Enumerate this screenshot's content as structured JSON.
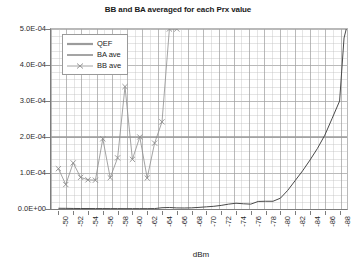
{
  "chart_data": {
    "type": "line",
    "title": "BB and BA averaged for each Prx value",
    "xlabel": "dBm",
    "ylabel": "",
    "xlim": [
      -49,
      -89
    ],
    "ylim": [
      0,
      0.0005
    ],
    "grid": true,
    "legend_position": "top-left",
    "x_tick_labels": [
      "-50",
      "-52",
      "-54",
      "-56",
      "-58",
      "-60",
      "-62",
      "-64",
      "-66",
      "-68",
      "-70",
      "-72",
      "-74",
      "-76",
      "-78",
      "-80",
      "-82",
      "-84",
      "-86",
      "-88"
    ],
    "x_tick_values": [
      -50,
      -52,
      -54,
      -56,
      -58,
      -60,
      -62,
      -64,
      -66,
      -68,
      -70,
      -72,
      -74,
      -76,
      -78,
      -80,
      -82,
      -84,
      -86,
      -88
    ],
    "y_tick_labels": [
      "0.0E+00",
      "1.0E-04",
      "2.0E-04",
      "3.0E-04",
      "4.0E-04",
      "5.0E-04"
    ],
    "y_tick_values": [
      0,
      0.0001,
      0.0002,
      0.0003,
      0.0004,
      0.0005
    ],
    "series": [
      {
        "name": "QEF",
        "style": "horizontal-threshold-line",
        "color": "#9b9b9b",
        "value": 0.0002,
        "x": [
          -49,
          -89
        ],
        "values": [
          0.0002,
          0.0002
        ]
      },
      {
        "name": "BA ave",
        "style": "line",
        "color": "#4a4a4a",
        "x": [
          -50,
          -51,
          -52,
          -53,
          -54,
          -55,
          -56,
          -57,
          -58,
          -59,
          -60,
          -61,
          -62,
          -63,
          -64,
          -65,
          -66,
          -67,
          -68,
          -69,
          -70,
          -71,
          -72,
          -73,
          -74,
          -75,
          -76,
          -77,
          -78,
          -79,
          -80,
          -81,
          -82,
          -83,
          -84,
          -85,
          -86,
          -87,
          -88,
          -88.6,
          -88.9
        ],
        "values": [
          2e-06,
          1.8e-06,
          1.5e-06,
          1.4e-06,
          1.3e-06,
          1.2e-06,
          1.2e-06,
          1.1e-06,
          1.1e-06,
          1e-06,
          1e-06,
          1e-06,
          1e-06,
          1.2e-06,
          3.5e-06,
          4.2e-06,
          3e-06,
          2.8e-06,
          3.2e-06,
          4.5e-06,
          6e-06,
          7.5e-06,
          1e-05,
          1.35e-05,
          1.6e-05,
          1.45e-05,
          1.35e-05,
          2.1e-05,
          2.15e-05,
          2.15e-05,
          3e-05,
          5.2e-05,
          7.9e-05,
          0.000106,
          0.000136,
          0.000168,
          0.000205,
          0.000252,
          0.0003,
          0.000475,
          0.0005
        ]
      },
      {
        "name": "BB ave",
        "style": "line-with-x-markers",
        "color": "#8d8d8d",
        "marker": "x",
        "x": [
          -50,
          -51,
          -52,
          -53,
          -54,
          -55,
          -56,
          -57,
          -58,
          -59,
          -60,
          -61,
          -62,
          -63,
          -64,
          -65,
          -66
        ],
        "values": [
          0.000112,
          6.8e-05,
          0.000128,
          8.8e-05,
          8.1e-05,
          8e-05,
          0.000195,
          8.7e-05,
          0.000142,
          0.00034,
          0.000138,
          0.0002,
          8.6e-05,
          0.000183,
          0.000242,
          0.0005,
          0.0005
        ]
      }
    ],
    "annotations": []
  },
  "legend": {
    "items": [
      {
        "label": "QEF"
      },
      {
        "label": "BA ave"
      },
      {
        "label": "BB ave"
      }
    ]
  }
}
